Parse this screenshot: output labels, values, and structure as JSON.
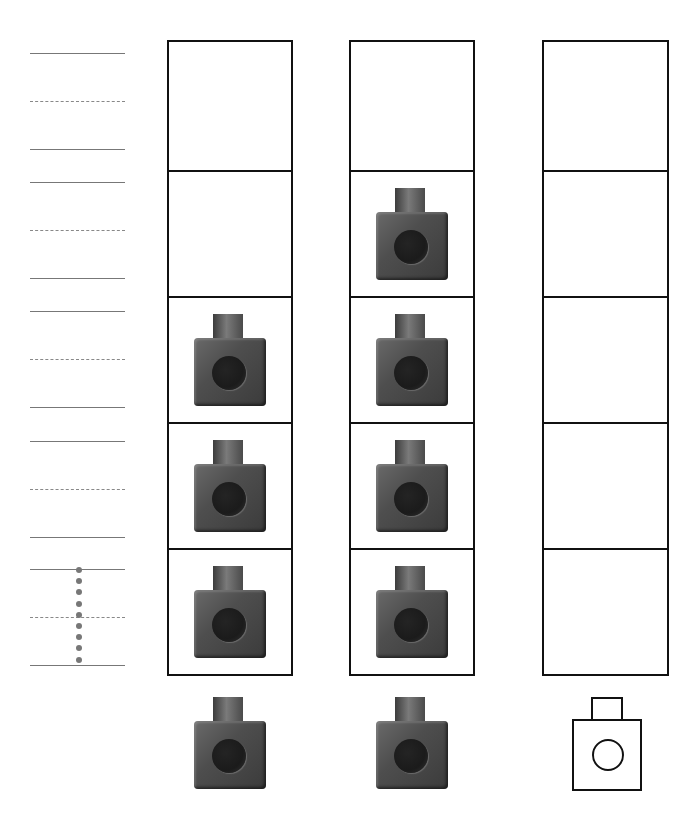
{
  "worksheet": {
    "handwriting_guide": {
      "bands": [
        {
          "top": 53,
          "trace": false
        },
        {
          "top": 182,
          "trace": false
        },
        {
          "top": 311,
          "trace": false
        },
        {
          "top": 441,
          "trace": false
        },
        {
          "top": 569,
          "trace": true,
          "trace_digit": "1"
        }
      ]
    },
    "columns": [
      {
        "name": "column-1",
        "cells": 5,
        "filled_cubes": 3,
        "below_cube": "filled"
      },
      {
        "name": "column-2",
        "cells": 5,
        "filled_cubes": 4,
        "below_cube": "filled"
      },
      {
        "name": "column-3",
        "cells": 5,
        "filled_cubes": 0,
        "below_cube": "outline"
      }
    ],
    "colors": {
      "cube_body": "#4e4e4e",
      "cube_hole": "#1b1b1b",
      "grid_border": "#111111",
      "guide_line": "#777777"
    }
  }
}
